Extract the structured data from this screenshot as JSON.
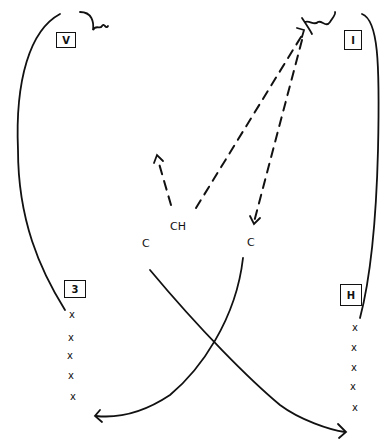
{
  "diagram": {
    "boxes": [
      {
        "id": "top-left",
        "label": "V"
      },
      {
        "id": "top-right",
        "label": "I"
      },
      {
        "id": "bottom-left",
        "label": "3"
      },
      {
        "id": "bottom-right",
        "label": "H"
      }
    ],
    "atoms": [
      {
        "id": "c-left",
        "label": "C"
      },
      {
        "id": "ch-center",
        "label": "CH"
      },
      {
        "id": "c-right",
        "label": "C"
      }
    ],
    "x_marks": {
      "left": [
        "x",
        "x",
        "x",
        "x",
        "x"
      ],
      "right": [
        "x",
        "x",
        "x",
        "x",
        "x"
      ]
    },
    "stroke_color": "#111111",
    "background": "#ffffff"
  }
}
